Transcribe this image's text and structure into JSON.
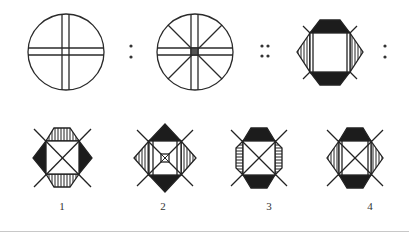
{
  "puzzle": {
    "type": "figure-analogy",
    "relation_text": "A : B :: C : ?",
    "separators": {
      "first": ":",
      "second": "::",
      "third": ":"
    },
    "colors": {
      "stroke": "#2a2a2a",
      "fill": "#1c1c1c",
      "background": "#ffffff",
      "baseline": "#c8c8c8"
    },
    "question_figures": [
      {
        "id": "A",
        "desc": "circle with double-line vertical and horizontal cross"
      },
      {
        "id": "B",
        "desc": "circle with double-line cross, four diagonal spokes and small dark square center"
      },
      {
        "id": "C",
        "desc": "square framed by black top/bottom caps and vertically striped left/right triangular caps, short diagonal stubs at corners"
      }
    ],
    "options": [
      {
        "label": "1",
        "top_bottom": "vertical-stripes",
        "left_right": "black",
        "center": "X"
      },
      {
        "label": "2",
        "top_bottom": "black",
        "left_right": "vertical-stripes",
        "center": "X with small center square"
      },
      {
        "label": "3",
        "top_bottom": "black",
        "left_right": "horizontal-stripes",
        "center": "X"
      },
      {
        "label": "4",
        "top_bottom": "black",
        "left_right": "vertical-stripes",
        "center": "X"
      }
    ]
  }
}
